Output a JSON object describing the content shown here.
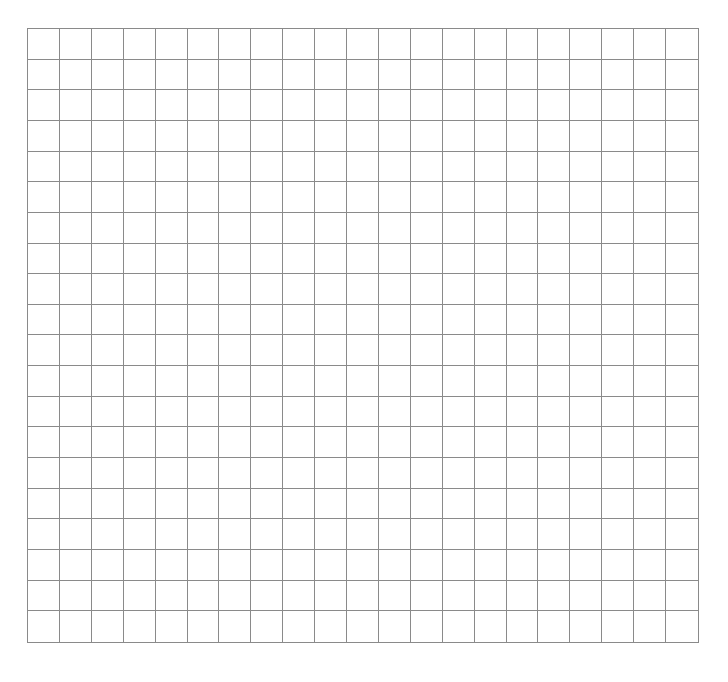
{
  "grid": {
    "columns": 21,
    "rows": 20,
    "line_color": "#8a8a8a",
    "background_color": "#ffffff",
    "cells_filled": []
  }
}
